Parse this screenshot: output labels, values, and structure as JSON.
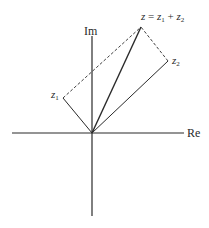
{
  "diagram": {
    "title": "",
    "axes": {
      "real_label": "Re",
      "imag_label": "Im"
    },
    "points": {
      "z1": {
        "label_main": "z",
        "label_sub": "1"
      },
      "z2": {
        "label_main": "z",
        "label_sub": "2"
      },
      "z": {
        "lhs": "z",
        "equals": " = ",
        "t1_main": "z",
        "t1_sub": "1",
        "plus": " + ",
        "t2_main": "z",
        "t2_sub": "2"
      }
    },
    "colors": {
      "line": "#2a2a2a",
      "background": "#ffffff"
    }
  }
}
